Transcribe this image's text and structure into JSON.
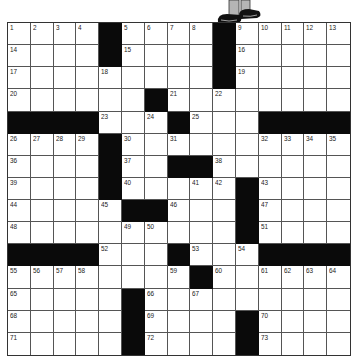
{
  "puzzle": {
    "rows": 15,
    "cols": 15,
    "block_color": "#0a0a0a",
    "cell_color": "#ffffff",
    "grid": [
      [
        "1",
        "2",
        "3",
        "4",
        "#",
        "5",
        "6",
        "7",
        "8",
        "#",
        "9",
        "10",
        "11",
        "12",
        "13"
      ],
      [
        "14",
        "",
        "",
        "",
        "#",
        "15",
        "",
        "",
        "",
        "#",
        "16",
        "",
        "",
        "",
        ""
      ],
      [
        "17",
        "",
        "",
        "",
        "18",
        "",
        "",
        "",
        "",
        "#",
        "19",
        "",
        "",
        "",
        ""
      ],
      [
        "20",
        "",
        "",
        "",
        "",
        "",
        "#",
        "21",
        "",
        "22",
        "",
        "",
        "",
        "",
        ""
      ],
      [
        "#",
        "#",
        "#",
        "#",
        "23",
        "",
        "24",
        "#",
        "25",
        "",
        "",
        "#",
        "#",
        "#",
        "#"
      ],
      [
        "26",
        "27",
        "28",
        "29",
        "#",
        "30",
        "",
        "31",
        "",
        "",
        "",
        "32",
        "33",
        "34",
        "35"
      ],
      [
        "36",
        "",
        "",
        "",
        "#",
        "37",
        "",
        "#",
        "#",
        "38",
        "",
        "",
        "",
        "",
        ""
      ],
      [
        "39",
        "",
        "",
        "",
        "#",
        "40",
        "",
        "",
        "41",
        "42",
        "#",
        "43",
        "",
        "",
        ""
      ],
      [
        "44",
        "",
        "",
        "",
        "45",
        "#",
        "#",
        "46",
        "",
        "",
        "#",
        "47",
        "",
        "",
        ""
      ],
      [
        "48",
        "",
        "",
        "",
        "",
        "49",
        "50",
        "",
        "",
        "",
        "#",
        "51",
        "",
        "",
        ""
      ],
      [
        "#",
        "#",
        "#",
        "#",
        "52",
        "",
        "",
        "#",
        "53",
        "",
        "54",
        "#",
        "#",
        "#",
        "#"
      ],
      [
        "55",
        "56",
        "57",
        "58",
        "",
        "",
        "",
        "59",
        "#",
        "60",
        "",
        "61",
        "62",
        "63",
        "64"
      ],
      [
        "65",
        "",
        "",
        "",
        "",
        "#",
        "66",
        "",
        "67",
        "",
        "",
        "",
        "",
        "",
        ""
      ],
      [
        "68",
        "",
        "",
        "",
        "",
        "#",
        "69",
        "",
        "",
        "",
        "#",
        "70",
        "",
        "",
        ""
      ],
      [
        "71",
        "",
        "",
        "",
        "",
        "#",
        "72",
        "",
        "",
        "",
        "#",
        "73",
        "",
        "",
        ""
      ]
    ]
  },
  "illustration": {
    "icon": "cartoon-legs-shoes-icon"
  }
}
